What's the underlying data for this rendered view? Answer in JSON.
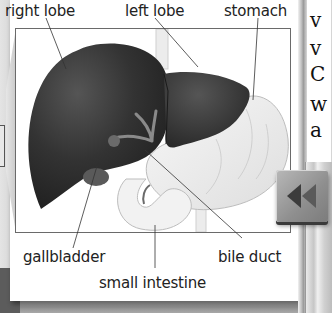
{
  "figure": {
    "labels": {
      "right_lobe": "right lobe",
      "left_lobe": "left lobe",
      "stomach": "stomach",
      "gallbladder": "gallbladder",
      "bile_duct": "bile duct",
      "small_intestine": "small intestine"
    },
    "colors": {
      "liver": "#2e2e2e",
      "stomach": "#f3f3f3",
      "frame_border": "#6a6a6a",
      "label_text": "#222222"
    }
  },
  "side_text": {
    "lines": [
      "v",
      "v",
      "C",
      "w",
      "a"
    ]
  },
  "navigation": {
    "back_button_icon": "rewind-double-chevron-left"
  }
}
